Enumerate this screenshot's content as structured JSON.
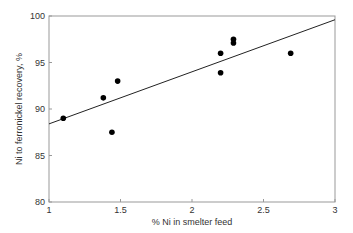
{
  "chart_data": {
    "type": "scatter",
    "title": "",
    "xlabel": "% Ni in smelter feed",
    "ylabel": "Ni to ferronickel recovery, %",
    "xlim": [
      1,
      3
    ],
    "ylim": [
      80,
      100
    ],
    "xticks": [
      1,
      1.5,
      2,
      2.5,
      3
    ],
    "xtick_labels": [
      "1",
      "1.5",
      "2",
      "2.5",
      "3"
    ],
    "yticks": [
      80,
      85,
      90,
      95,
      100
    ],
    "ytick_labels": [
      "80",
      "85",
      "90",
      "95",
      "100"
    ],
    "grid": false,
    "legend": null,
    "series": [
      {
        "name": "data",
        "x": [
          1.1,
          1.38,
          1.44,
          1.48,
          2.2,
          2.2,
          2.29,
          2.29,
          2.69
        ],
        "y": [
          89.0,
          91.2,
          87.5,
          93.0,
          96.0,
          93.9,
          97.5,
          97.1,
          96.0
        ]
      }
    ],
    "trendline": {
      "x": [
        1,
        3
      ],
      "y": [
        88.4,
        99.6
      ]
    }
  },
  "colors": {
    "axis": "#999999",
    "marker": "#000000",
    "line": "#222222"
  }
}
